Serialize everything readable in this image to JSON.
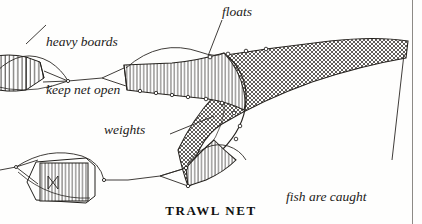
{
  "figure": {
    "title": "TRAWL NET",
    "ink_color": "#1c1a18",
    "paper_color": "#fefefd",
    "mesh_color": "#3a3734"
  },
  "labels": {
    "boards_line1": "heavy boards",
    "boards_line2": "keep net open",
    "floats": "floats",
    "weights": "weights",
    "fish_line1": "fish are caught",
    "fish_line2": "in end of net"
  },
  "parts": {
    "upper_board": "heavy board",
    "lower_board": "heavy board",
    "net_mouth_upper": "net mouth panel",
    "net_mouth_lower": "net mouth panel",
    "net_body": "mesh net body",
    "net_tail": "end of net",
    "floats_row": "floats",
    "tow_lines": "tow warps"
  }
}
